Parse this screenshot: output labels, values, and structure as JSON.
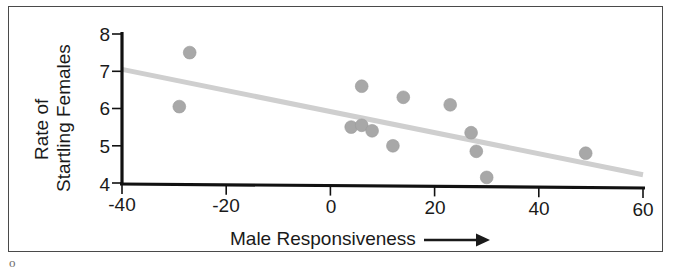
{
  "figure": {
    "page_mark": "o"
  },
  "chart_data": {
    "type": "scatter",
    "title": "",
    "subtitle": "",
    "xlabel": "Male Responsiveness",
    "xlabel_arrow": "⟶",
    "ylabel_line1": "Rate of",
    "ylabel_line2": "Startling Females",
    "xlim": [
      -40,
      60
    ],
    "ylim": [
      4,
      8
    ],
    "xticks": [
      -40,
      -20,
      0,
      20,
      40,
      60
    ],
    "xtick_labels": [
      "-40",
      "-20",
      "0",
      "20",
      "40",
      "60"
    ],
    "yticks": [
      4,
      5,
      6,
      7,
      8
    ],
    "ytick_labels": [
      "4",
      "5",
      "6",
      "7",
      "8"
    ],
    "grid": false,
    "legend": false,
    "point_color": "#a8a8a8",
    "trendline_color": "#cfcfcf",
    "axis_color": "#111111",
    "points": [
      {
        "x": -29,
        "y": 6.05
      },
      {
        "x": -27,
        "y": 7.5
      },
      {
        "x": 4,
        "y": 5.5
      },
      {
        "x": 6,
        "y": 6.6
      },
      {
        "x": 6,
        "y": 5.55
      },
      {
        "x": 8,
        "y": 5.4
      },
      {
        "x": 12,
        "y": 5.0
      },
      {
        "x": 14,
        "y": 6.3
      },
      {
        "x": 23,
        "y": 6.1
      },
      {
        "x": 27,
        "y": 5.35
      },
      {
        "x": 28,
        "y": 4.85
      },
      {
        "x": 30,
        "y": 4.15
      },
      {
        "x": 49,
        "y": 4.8
      }
    ],
    "trendline": {
      "x0": -40,
      "y0": 7.05,
      "x1": 60,
      "y1": 4.22
    }
  }
}
